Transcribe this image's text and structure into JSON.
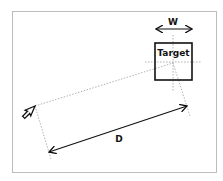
{
  "diagram": {
    "target_label": "Target",
    "width_label": "W",
    "distance_label": "D",
    "colors": {
      "frame": "#bdbdbd",
      "stroke": "#111111",
      "guide": "#9e9e9e",
      "background": "#ffffff"
    },
    "elements": {
      "cursor": "pointer-arrow-icon",
      "target": "square box",
      "width_arrow": "double-headed arrow over target",
      "distance_arrow": "double-headed arrow from cursor to target center",
      "guides": "dotted construction lines"
    }
  }
}
